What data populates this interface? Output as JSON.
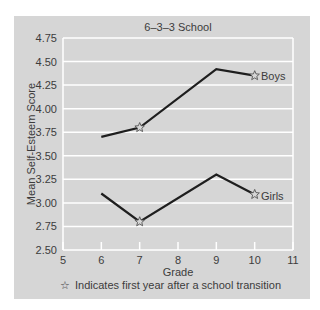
{
  "chart_data": {
    "type": "line",
    "title": "6–3–3 School",
    "xlabel": "Grade",
    "ylabel": "Mean Self-Esteem Score",
    "x": [
      6,
      7,
      9,
      10
    ],
    "xlim": [
      5,
      11
    ],
    "ylim": [
      2.5,
      4.75
    ],
    "x_ticks": [
      "5",
      "6",
      "7",
      "8",
      "9",
      "10",
      "11"
    ],
    "y_ticks": [
      "2.50",
      "2.75",
      "3.00",
      "3.25",
      "3.50",
      "3.75",
      "4.00",
      "4.25",
      "4.50",
      "4.75"
    ],
    "grid": true,
    "series": [
      {
        "name": "Boys",
        "x": [
          6,
          7,
          9,
          10
        ],
        "values": [
          3.7,
          3.8,
          4.42,
          4.35
        ],
        "star_at": [
          7,
          10
        ]
      },
      {
        "name": "Girls",
        "x": [
          6,
          7,
          9,
          10
        ],
        "values": [
          3.1,
          2.8,
          3.3,
          3.09
        ],
        "star_at": [
          7,
          10
        ]
      }
    ],
    "annotation": "☆ Indicates first year after a school transition",
    "legend_position": "inline labels at line ends"
  },
  "labels": {
    "title": "6–3–3 School",
    "xlabel": "Grade",
    "ylabel": "Mean Self-Esteem Score",
    "boys": "Boys",
    "girls": "Girls",
    "note": "Indicates first year after a school transition",
    "note_icon": "☆"
  },
  "colors": {
    "panel": "#d6d6d6",
    "grid": "#ffffff",
    "line": "#1e1e1e"
  }
}
